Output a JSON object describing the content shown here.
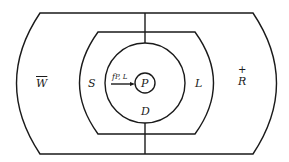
{
  "diagram": {
    "regions": {
      "outer_left": {
        "label": "W",
        "decoration": "overbar"
      },
      "outer_right": {
        "label": "R",
        "decoration": "plus-above",
        "decoration_symbol": "+"
      },
      "middle_left": {
        "label": "S"
      },
      "middle_right": {
        "label": "L"
      },
      "inner_circle": {
        "label": "D"
      },
      "center_circle": {
        "label": "P"
      }
    },
    "arrow": {
      "label": "f",
      "subscript": "P, L"
    },
    "colors": {
      "stroke": "#1a1a1a",
      "background": "#ffffff"
    }
  }
}
